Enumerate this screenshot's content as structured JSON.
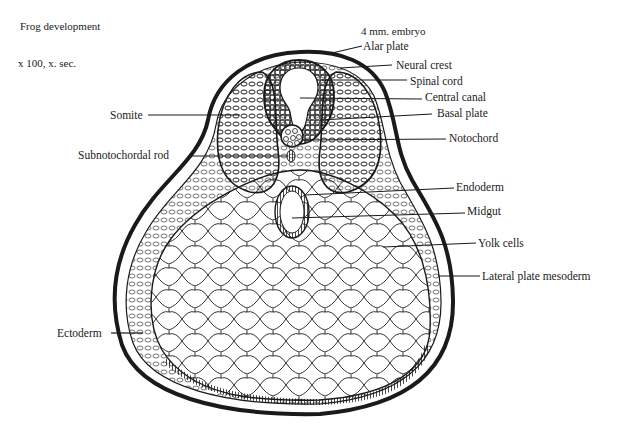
{
  "header": {
    "title": "Frog development",
    "magnification": "x 100, x. sec.",
    "stage": "4 mm. embryo"
  },
  "labels": {
    "alar_plate": "Alar plate",
    "neural_crest": "Neural crest",
    "spinal_cord": "Spinal cord",
    "central_canal": "Central canal",
    "basal_plate": "Basal plate",
    "notochord": "Notochord",
    "endoderm": "Endoderm",
    "midgut": "Midgut",
    "yolk_cells": "Yolk cells",
    "lateral_plate_mesoderm": "Lateral plate mesoderm",
    "somite": "Somite",
    "subnotochordal_rod": "Subnotochordal rod",
    "ectoderm": "Ectoderm"
  },
  "colors": {
    "ink": "#1a1a1a",
    "background": "#ffffff"
  }
}
